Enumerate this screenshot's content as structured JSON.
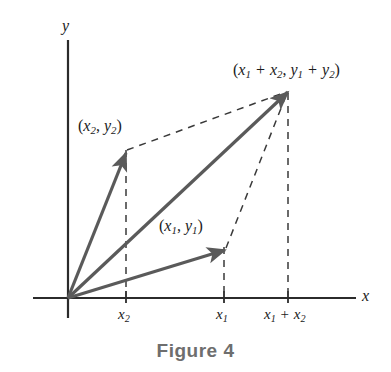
{
  "figure": {
    "caption": "Figure 4",
    "caption_color": "#6e6e6e",
    "axes": {
      "x_label": "x",
      "y_label": "y",
      "axis_color": "#2b2b2b",
      "origin": [
        68,
        298
      ]
    },
    "vector_color": "#5a5a5a",
    "dashed_color": "#3a3a3a",
    "vectors": [
      {
        "name": "vector-v2",
        "label_plain": "(x2, y2)",
        "label_parts": {
          "open": "(",
          "x": "x",
          "x_sub": "2",
          "comma": ",",
          "y": "y",
          "y_sub": "2",
          "close": ")"
        },
        "tip": [
          126,
          152
        ],
        "tail": [
          68,
          298
        ]
      },
      {
        "name": "vector-v1",
        "label_plain": "(x1, y1)",
        "label_parts": {
          "open": "(",
          "x": "x",
          "x_sub": "1",
          "comma": ",",
          "y": "y",
          "y_sub": "1",
          "close": ")"
        },
        "tip": [
          225,
          249
        ],
        "tail": [
          68,
          298
        ]
      },
      {
        "name": "vector-sum",
        "label_plain": "(x1 + x2, y1 + y2)",
        "label_parts": {
          "open": "(",
          "x_a": "x",
          "x_a_sub": "1",
          "plus_a": "+",
          "x_b": "x",
          "x_b_sub": "2",
          "comma": ",",
          "y_a": "y",
          "y_a_sub": "1",
          "plus_b": "+",
          "y_b": "y",
          "y_b_sub": "2",
          "close": ")"
        },
        "tip": [
          288,
          91
        ],
        "tail": [
          68,
          298
        ]
      }
    ],
    "x_ticks": [
      {
        "name": "tick-x2",
        "pos": 126,
        "label_plain": "x2",
        "sym": "x",
        "sub": "2"
      },
      {
        "name": "tick-x1",
        "pos": 224,
        "label_plain": "x1",
        "sym": "x",
        "sub": "1"
      },
      {
        "name": "tick-x1-plus-x2",
        "pos": 288,
        "label_plain": "x1 + x2",
        "sym": "x",
        "sub": "1",
        "op": "+",
        "sym2": "x",
        "sub2": "2"
      }
    ]
  }
}
